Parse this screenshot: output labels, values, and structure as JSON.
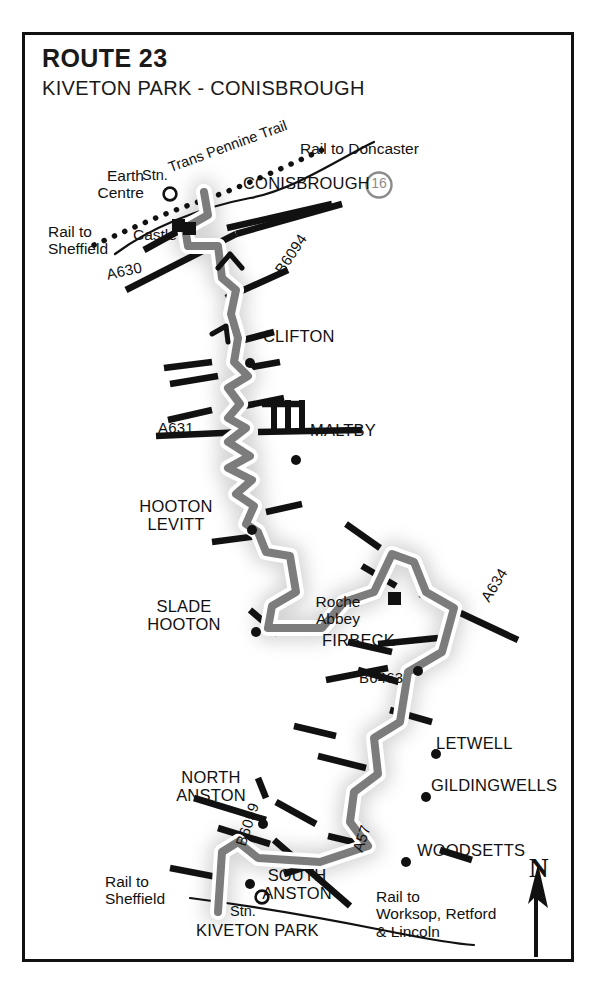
{
  "document": {
    "type": "cycle-route-map",
    "title": "ROUTE 23",
    "subtitle": "KIVETON PARK - CONISBROUGH"
  },
  "map": {
    "route_color": "#7c7c7c",
    "route_casing_color": "#ffffff",
    "road_color": "#111111",
    "shadow_color": "#b9b9b9",
    "frame_color": "#111111",
    "badge": {
      "label": "16",
      "color": "#8b8b8b"
    },
    "north_arrow": {
      "letter": "N"
    },
    "places": [
      {
        "name": "CONISBROUGH",
        "marker": "none",
        "x": 242,
        "y": 183
      },
      {
        "name": "CLIFTON",
        "marker": "dot",
        "x": 264,
        "y": 336
      },
      {
        "name": "MALTBY",
        "marker": "dot",
        "x": 310,
        "y": 431
      },
      {
        "name": "HOOTON\nLEVITT",
        "marker": "dot",
        "x": 181,
        "y": 512
      },
      {
        "name": "SLADE\nHOOTON",
        "marker": "dot",
        "x": 209,
        "y": 607
      },
      {
        "name": "FIRBECK",
        "marker": "dot",
        "x": 353,
        "y": 644
      },
      {
        "name": "LETWELL",
        "marker": "dot",
        "x": 440,
        "y": 743
      },
      {
        "name": "GILDINGWELLS",
        "marker": "dot",
        "x": 435,
        "y": 786
      },
      {
        "name": "WOODSETTS",
        "marker": "dot",
        "x": 422,
        "y": 851
      },
      {
        "name": "NORTH\nANSTON",
        "marker": "dot",
        "x": 207,
        "y": 778
      },
      {
        "name": "SOUTH\nANSTON",
        "marker": "dot",
        "x": 277,
        "y": 876
      },
      {
        "name": "KIVETON PARK",
        "marker": "none",
        "x": 202,
        "y": 926
      }
    ],
    "landmarks": [
      {
        "name": "Earth\nCentre",
        "marker": "square",
        "x": 90,
        "y": 175
      },
      {
        "name": "Castle",
        "marker": "square",
        "x": 139,
        "y": 235
      },
      {
        "name": "Roche\nAbbey",
        "marker": "square",
        "x": 337,
        "y": 600
      }
    ],
    "stations": [
      {
        "name": "Stn.",
        "x": 144,
        "y": 171
      },
      {
        "name": "Stn.",
        "x": 232,
        "y": 908
      }
    ],
    "roads": [
      {
        "label": "A630",
        "x": 107,
        "y": 273
      },
      {
        "label": "B6094",
        "x": 273,
        "y": 277
      },
      {
        "label": "A631",
        "x": 185,
        "y": 426
      },
      {
        "label": "A634",
        "x": 483,
        "y": 604
      },
      {
        "label": "B6463",
        "x": 362,
        "y": 678
      },
      {
        "label": "B6059",
        "x": 236,
        "y": 851
      },
      {
        "label": "A57",
        "x": 353,
        "y": 857
      }
    ],
    "rail_labels": [
      {
        "text": "Rail to Doncaster",
        "x": 300,
        "y": 146
      },
      {
        "text": "Rail to\nSheffield",
        "x": 48,
        "y": 228
      },
      {
        "text": "Rail to\nSheffield",
        "x": 107,
        "y": 879
      },
      {
        "text": "Rail to\nWorksop, Retford\n& Lincoln",
        "x": 376,
        "y": 894
      }
    ],
    "trail_label": {
      "text": "Trans Pennine Trail",
      "x": 170,
      "y": 150
    }
  }
}
